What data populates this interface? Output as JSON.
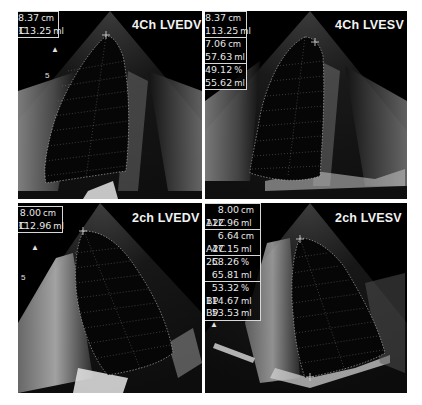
{
  "figure": {
    "panels": [
      {
        "id": "top-left",
        "title": "4Ch LVEDV",
        "measurements": [
          {
            "prefix": "",
            "value": "8.37",
            "unit": "cm"
          },
          {
            "prefix": "C",
            "value": "113.25",
            "unit": "ml"
          }
        ]
      },
      {
        "id": "top-right",
        "title": "4Ch LVESV",
        "measurements": [
          {
            "prefix": "",
            "value": "8.37",
            "unit": "cm"
          },
          {
            "prefix": "",
            "value": "113.25",
            "unit": "ml"
          },
          {
            "prefix": "",
            "value": "7.06",
            "unit": "cm"
          },
          {
            "prefix": "",
            "value": "57.63",
            "unit": "ml"
          },
          {
            "prefix": "",
            "value": "49.12",
            "unit": "%"
          },
          {
            "prefix": "",
            "value": "55.62",
            "unit": "ml"
          }
        ]
      },
      {
        "id": "bottom-left",
        "title": "2ch LVEDV",
        "measurements": [
          {
            "prefix": "",
            "value": "8.00",
            "unit": "cm"
          },
          {
            "prefix": "C",
            "value": "112.96",
            "unit": "ml"
          }
        ]
      },
      {
        "id": "bottom-right",
        "title": "2ch LVESV",
        "measurements": [
          {
            "prefix": "",
            "value": "8.00",
            "unit": "cm"
          },
          {
            "prefix": "A2C",
            "value": "112.96",
            "unit": "ml"
          },
          {
            "prefix": "",
            "value": "6.64",
            "unit": "cm"
          },
          {
            "prefix": "A2C",
            "value": "47.15",
            "unit": "ml"
          },
          {
            "prefix": "2C",
            "value": "58.26",
            "unit": "%"
          },
          {
            "prefix": "",
            "value": "65.81",
            "unit": "ml"
          },
          {
            "prefix": "",
            "value": "53.32",
            "unit": "%"
          },
          {
            "prefix": "BP",
            "value": "114.67",
            "unit": "ml"
          },
          {
            "prefix": "BP",
            "value": "53.53",
            "unit": "ml"
          }
        ]
      }
    ],
    "depth_marker": "5",
    "colors": {
      "background": "#ffffff",
      "panel": "#000000",
      "text": "#f2f2f2",
      "trace": "#cfcfcf"
    }
  }
}
